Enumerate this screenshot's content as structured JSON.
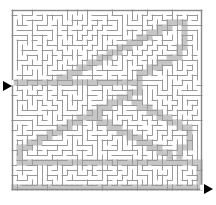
{
  "figure": {
    "kind": "maze-puzzle",
    "title": "",
    "width": 216,
    "height": 205
  },
  "colors": {
    "background": "#ffffff",
    "wall": "#9a9a9a",
    "border": "#8a8a8a",
    "path_fill": "#c6c6c6",
    "arrow": "#000000",
    "corridor": "#ffffff"
  },
  "maze": {
    "origin_x": 12,
    "origin_y": 10,
    "cell": 5,
    "cols": 38,
    "rows": 36,
    "border_width": 1.4,
    "wall_width": 1.0,
    "wall_seed": 20240517,
    "entrance": {
      "label": "entrance",
      "side": "left",
      "row": 14,
      "arrow_x": 3,
      "arrow_y": 81
    },
    "exit": {
      "label": "exit",
      "side": "right",
      "row": 35,
      "arrow_x": 204,
      "arrow_y": 184
    }
  },
  "solution": {
    "label": "solution-path",
    "stroke_cells": 5,
    "cells": [
      [
        0,
        14
      ],
      [
        1,
        14
      ],
      [
        2,
        14
      ],
      [
        3,
        14
      ],
      [
        4,
        14
      ],
      [
        5,
        14
      ],
      [
        6,
        14
      ],
      [
        7,
        14
      ],
      [
        8,
        14
      ],
      [
        9,
        14
      ],
      [
        10,
        14
      ],
      [
        11,
        14
      ],
      [
        12,
        14
      ],
      [
        13,
        14
      ],
      [
        14,
        14
      ],
      [
        15,
        14
      ],
      [
        16,
        14
      ],
      [
        17,
        14
      ],
      [
        18,
        14
      ],
      [
        19,
        14
      ],
      [
        20,
        14
      ],
      [
        21,
        14
      ],
      [
        22,
        14
      ],
      [
        23,
        14
      ],
      [
        24,
        14
      ],
      [
        25,
        14
      ],
      [
        25,
        13
      ],
      [
        25,
        12
      ],
      [
        26,
        12
      ],
      [
        27,
        12
      ],
      [
        27,
        11
      ],
      [
        28,
        11
      ],
      [
        29,
        11
      ],
      [
        29,
        10
      ],
      [
        30,
        10
      ],
      [
        31,
        10
      ],
      [
        31,
        9
      ],
      [
        32,
        9
      ],
      [
        33,
        9
      ],
      [
        33,
        8
      ],
      [
        33,
        7
      ],
      [
        34,
        7
      ],
      [
        34,
        6
      ],
      [
        34,
        5
      ],
      [
        34,
        4
      ],
      [
        34,
        3
      ],
      [
        34,
        2
      ],
      [
        33,
        2
      ],
      [
        32,
        2
      ],
      [
        31,
        2
      ],
      [
        31,
        3
      ],
      [
        30,
        3
      ],
      [
        29,
        3
      ],
      [
        29,
        4
      ],
      [
        28,
        4
      ],
      [
        27,
        4
      ],
      [
        27,
        5
      ],
      [
        26,
        5
      ],
      [
        25,
        5
      ],
      [
        25,
        6
      ],
      [
        24,
        6
      ],
      [
        23,
        6
      ],
      [
        23,
        7
      ],
      [
        22,
        7
      ],
      [
        21,
        7
      ],
      [
        21,
        8
      ],
      [
        20,
        8
      ],
      [
        19,
        8
      ],
      [
        19,
        9
      ],
      [
        18,
        9
      ],
      [
        17,
        9
      ],
      [
        17,
        10
      ],
      [
        16,
        10
      ],
      [
        15,
        10
      ],
      [
        15,
        11
      ],
      [
        14,
        11
      ],
      [
        13,
        11
      ],
      [
        13,
        12
      ],
      [
        12,
        12
      ],
      [
        11,
        12
      ],
      [
        11,
        13
      ],
      [
        10,
        13
      ],
      [
        9,
        13
      ],
      [
        9,
        14
      ],
      [
        25,
        15
      ],
      [
        25,
        16
      ],
      [
        24,
        16
      ],
      [
        23,
        16
      ],
      [
        23,
        17
      ],
      [
        22,
        17
      ],
      [
        21,
        17
      ],
      [
        21,
        18
      ],
      [
        20,
        18
      ],
      [
        19,
        18
      ],
      [
        19,
        19
      ],
      [
        18,
        19
      ],
      [
        17,
        19
      ],
      [
        17,
        20
      ],
      [
        16,
        20
      ],
      [
        15,
        20
      ],
      [
        15,
        21
      ],
      [
        14,
        21
      ],
      [
        13,
        21
      ],
      [
        13,
        22
      ],
      [
        12,
        22
      ],
      [
        11,
        22
      ],
      [
        11,
        23
      ],
      [
        10,
        23
      ],
      [
        9,
        23
      ],
      [
        9,
        24
      ],
      [
        8,
        24
      ],
      [
        7,
        24
      ],
      [
        7,
        25
      ],
      [
        6,
        25
      ],
      [
        5,
        25
      ],
      [
        5,
        26
      ],
      [
        4,
        26
      ],
      [
        3,
        26
      ],
      [
        3,
        27
      ],
      [
        2,
        27
      ],
      [
        1,
        27
      ],
      [
        1,
        28
      ],
      [
        1,
        29
      ],
      [
        1,
        30
      ],
      [
        2,
        30
      ],
      [
        3,
        30
      ],
      [
        4,
        30
      ],
      [
        5,
        30
      ],
      [
        6,
        30
      ],
      [
        7,
        30
      ],
      [
        8,
        30
      ],
      [
        9,
        30
      ],
      [
        10,
        30
      ],
      [
        11,
        30
      ],
      [
        12,
        30
      ],
      [
        13,
        30
      ],
      [
        14,
        30
      ],
      [
        15,
        30
      ],
      [
        16,
        30
      ],
      [
        17,
        30
      ],
      [
        18,
        30
      ],
      [
        19,
        30
      ],
      [
        20,
        30
      ],
      [
        21,
        30
      ],
      [
        22,
        30
      ],
      [
        23,
        30
      ],
      [
        24,
        30
      ],
      [
        25,
        30
      ],
      [
        26,
        30
      ],
      [
        27,
        30
      ],
      [
        28,
        30
      ],
      [
        29,
        30
      ],
      [
        30,
        30
      ],
      [
        31,
        30
      ],
      [
        32,
        30
      ],
      [
        33,
        30
      ],
      [
        34,
        30
      ],
      [
        35,
        30
      ],
      [
        36,
        30
      ],
      [
        37,
        30
      ],
      [
        37,
        31
      ],
      [
        37,
        32
      ],
      [
        37,
        33
      ],
      [
        37,
        34
      ],
      [
        37,
        35
      ],
      [
        36,
        35
      ],
      [
        35,
        35
      ],
      [
        34,
        35
      ],
      [
        33,
        35
      ],
      [
        32,
        35
      ],
      [
        31,
        35
      ],
      [
        30,
        35
      ],
      [
        29,
        35
      ],
      [
        28,
        35
      ],
      [
        27,
        35
      ],
      [
        26,
        35
      ],
      [
        25,
        35
      ],
      [
        24,
        35
      ],
      [
        23,
        35
      ],
      [
        22,
        35
      ],
      [
        21,
        35
      ],
      [
        20,
        35
      ],
      [
        19,
        35
      ],
      [
        18,
        35
      ],
      [
        17,
        35
      ],
      [
        16,
        35
      ],
      [
        15,
        35
      ],
      [
        14,
        35
      ],
      [
        13,
        35
      ],
      [
        12,
        35
      ],
      [
        11,
        35
      ],
      [
        10,
        35
      ],
      [
        9,
        35
      ],
      [
        8,
        35
      ],
      [
        7,
        35
      ],
      [
        6,
        35
      ],
      [
        5,
        35
      ],
      [
        4,
        35
      ],
      [
        3,
        35
      ],
      [
        2,
        35
      ],
      [
        1,
        35
      ],
      [
        0,
        35
      ],
      [
        31,
        29
      ],
      [
        31,
        28
      ],
      [
        30,
        28
      ],
      [
        29,
        28
      ],
      [
        29,
        27
      ],
      [
        28,
        27
      ],
      [
        27,
        27
      ],
      [
        27,
        26
      ],
      [
        26,
        26
      ],
      [
        25,
        26
      ],
      [
        25,
        25
      ],
      [
        24,
        25
      ],
      [
        23,
        25
      ],
      [
        23,
        24
      ],
      [
        22,
        24
      ],
      [
        21,
        24
      ],
      [
        21,
        23
      ],
      [
        20,
        23
      ],
      [
        19,
        23
      ],
      [
        19,
        22
      ],
      [
        18,
        22
      ],
      [
        17,
        22
      ],
      [
        17,
        21
      ],
      [
        16,
        21
      ],
      [
        33,
        29
      ],
      [
        33,
        28
      ],
      [
        33,
        27
      ],
      [
        34,
        27
      ],
      [
        35,
        27
      ],
      [
        35,
        26
      ],
      [
        35,
        25
      ],
      [
        35,
        24
      ],
      [
        35,
        23
      ],
      [
        34,
        23
      ],
      [
        33,
        23
      ],
      [
        33,
        22
      ],
      [
        32,
        22
      ],
      [
        31,
        22
      ],
      [
        31,
        21
      ],
      [
        30,
        21
      ],
      [
        29,
        21
      ],
      [
        29,
        20
      ],
      [
        28,
        20
      ],
      [
        27,
        20
      ],
      [
        27,
        19
      ],
      [
        26,
        19
      ],
      [
        25,
        19
      ],
      [
        25,
        18
      ],
      [
        24,
        18
      ]
    ]
  }
}
